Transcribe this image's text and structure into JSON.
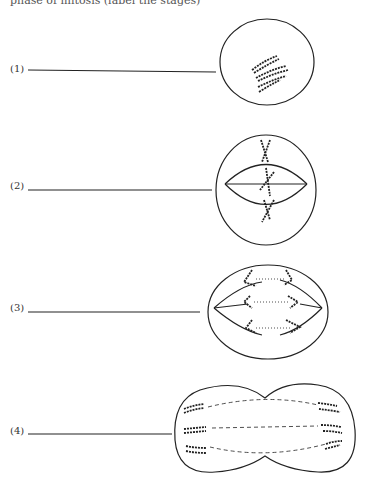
{
  "header": {
    "text": "phase of mitosis (label the stages)"
  },
  "stages": [
    {
      "label": "(1)",
      "phase_drawing": "prophase"
    },
    {
      "label": "(2)",
      "phase_drawing": "metaphase"
    },
    {
      "label": "(3)",
      "phase_drawing": "anaphase"
    },
    {
      "label": "(4)",
      "phase_drawing": "telophase"
    }
  ]
}
